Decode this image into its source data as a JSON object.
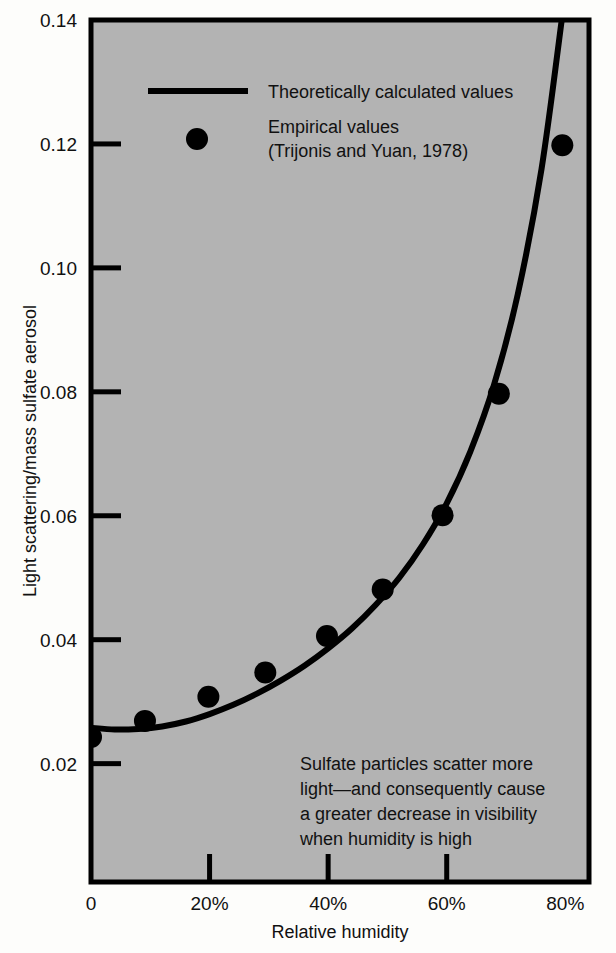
{
  "chart_data": {
    "type": "scatter",
    "title": "",
    "xlabel": "Relative humidity",
    "ylabel": "Light scattering/mass sulfate aerosol",
    "xlim": [
      0,
      84
    ],
    "ylim": [
      0.0009,
      0.14
    ],
    "grid": false,
    "plot_background": "#b3b3b3",
    "foreground": "#000000",
    "xticks": [
      {
        "value": 0,
        "label": "0"
      },
      {
        "value": 20,
        "label": "20%"
      },
      {
        "value": 40,
        "label": "40%"
      },
      {
        "value": 60,
        "label": "60%"
      },
      {
        "value": 80,
        "label": "80%"
      }
    ],
    "yticks": [
      {
        "value": 0.02,
        "label": "0.02"
      },
      {
        "value": 0.04,
        "label": "0.04"
      },
      {
        "value": 0.06,
        "label": "0.06"
      },
      {
        "value": 0.08,
        "label": "0.08"
      },
      {
        "value": 0.1,
        "label": "0.10"
      },
      {
        "value": 0.12,
        "label": "0.12"
      },
      {
        "value": 0.14,
        "label": "0.14"
      }
    ],
    "series": [
      {
        "name": "Theoretically calculated values",
        "type": "line",
        "x": [
          0,
          4,
          8,
          12,
          16,
          20,
          24,
          28,
          32,
          36,
          40,
          44,
          48,
          52,
          56,
          60,
          64,
          68,
          72,
          76,
          79.4
        ],
        "y": [
          0.0258,
          0.0255,
          0.0256,
          0.026,
          0.0268,
          0.028,
          0.0295,
          0.0313,
          0.0334,
          0.0358,
          0.0386,
          0.0418,
          0.0456,
          0.05,
          0.0554,
          0.062,
          0.0704,
          0.0812,
          0.0958,
          0.116,
          0.14
        ]
      },
      {
        "name": "Empirical values (Trijonis and Yuan, 1978)",
        "type": "scatter",
        "x": [
          0,
          9.1,
          19.8,
          29.4,
          39.8,
          49.2,
          59.3,
          68.8,
          79.5
        ],
        "y": [
          0.0243,
          0.0269,
          0.0308,
          0.0347,
          0.0406,
          0.0481,
          0.0601,
          0.0797,
          0.1198
        ]
      }
    ]
  },
  "legend": {
    "line_entry": "Theoretically calculated values",
    "dot_entry_line1": "Empirical values",
    "dot_entry_line2": "(Trijonis and Yuan, 1978)"
  },
  "annotation": {
    "line1": "Sulfate particles scatter more",
    "line2": "light—and consequently cause",
    "line3": "a greater decrease in visibility",
    "line4": "when humidity is high"
  }
}
